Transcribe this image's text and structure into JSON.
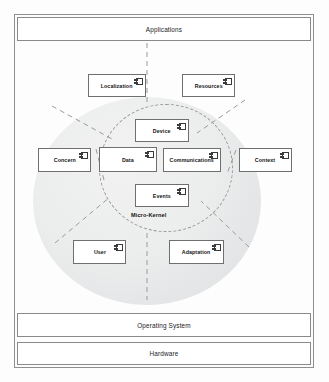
{
  "diagram": {
    "frame": {
      "name": "diagram-frame"
    },
    "layers": [
      {
        "id": "applications",
        "label": "Applications"
      },
      {
        "id": "operating-system",
        "label": "Operating System"
      },
      {
        "id": "hardware",
        "label": "Hardware"
      }
    ],
    "kernel": {
      "caption": "Micro-Kernel",
      "icon": "uml-component-icon"
    },
    "components": [
      {
        "id": "localization",
        "label": "Localization",
        "ring": "outer",
        "x": 88,
        "y": 74,
        "w": 58,
        "h": 23
      },
      {
        "id": "resources",
        "label": "Resources",
        "ring": "outer",
        "x": 182,
        "y": 74,
        "w": 53,
        "h": 23
      },
      {
        "id": "device",
        "label": "Device",
        "ring": "kernel",
        "x": 135,
        "y": 119,
        "w": 54,
        "h": 23
      },
      {
        "id": "concern",
        "label": "Concern",
        "ring": "outer",
        "x": 38,
        "y": 148,
        "w": 53,
        "h": 24
      },
      {
        "id": "data",
        "label": "Data",
        "ring": "kernel",
        "x": 99,
        "y": 147,
        "w": 58,
        "h": 25
      },
      {
        "id": "communications",
        "label": "Communications",
        "ring": "kernel",
        "x": 163,
        "y": 148,
        "w": 58,
        "h": 24
      },
      {
        "id": "context",
        "label": "Context",
        "ring": "outer",
        "x": 239,
        "y": 148,
        "w": 53,
        "h": 24
      },
      {
        "id": "events",
        "label": "Events",
        "ring": "kernel",
        "x": 135,
        "y": 184,
        "w": 54,
        "h": 23
      },
      {
        "id": "user",
        "label": "User",
        "ring": "outer",
        "x": 73,
        "y": 240,
        "w": 53,
        "h": 24
      },
      {
        "id": "adaptation",
        "label": "Adaptation",
        "ring": "outer",
        "x": 169,
        "y": 240,
        "w": 55,
        "h": 24
      }
    ],
    "connectors": [
      {
        "id": "kernel-to-applications",
        "x1": 147,
        "y1": 43,
        "x2": 147,
        "y2": 104
      },
      {
        "id": "kernel-to-localization",
        "x1": 52,
        "y1": 105,
        "x2": 110,
        "y2": 138
      },
      {
        "id": "kernel-to-resources",
        "x1": 243,
        "y1": 100,
        "x2": 196,
        "y2": 134
      },
      {
        "id": "kernel-to-concern",
        "x1": 95,
        "y1": 150,
        "x2": 104,
        "y2": 178
      },
      {
        "id": "kernel-to-context",
        "x1": 236,
        "y1": 150,
        "x2": 226,
        "y2": 172
      },
      {
        "id": "kernel-to-user",
        "x1": 55,
        "y1": 242,
        "x2": 110,
        "y2": 196
      },
      {
        "id": "kernel-to-adaptation",
        "x1": 247,
        "y1": 246,
        "x2": 200,
        "y2": 200
      },
      {
        "id": "kernel-to-bottom",
        "x1": 147,
        "y1": 232,
        "x2": 147,
        "y2": 300
      }
    ],
    "colors": {
      "frame_border": "#8e8e8e",
      "banner_border": "#8a8a8a",
      "component_border": "#6f6f6f",
      "circle_fill": "#e9eaea",
      "dashed_stroke": "#9a9a9a",
      "text": "#141414",
      "background": "#fdfdfd"
    }
  }
}
